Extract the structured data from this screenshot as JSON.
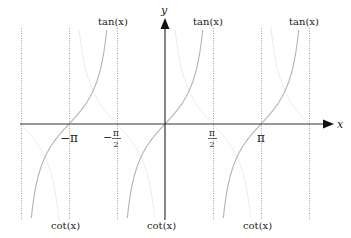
{
  "chart_data": {
    "type": "line",
    "title": "",
    "xlabel": "x",
    "ylabel": "y",
    "x_range": [
      -4.712,
      4.712
    ],
    "y_range": [
      -3,
      3
    ],
    "grid": false,
    "x_tick_labels": [
      "−π",
      "−π/2",
      "π/2",
      "π"
    ],
    "x_tick_values": [
      -3.1416,
      -1.5708,
      1.5708,
      3.1416
    ],
    "asymptotes_x": [
      -4.712,
      -3.1416,
      -1.5708,
      1.5708,
      3.1416,
      4.712
    ],
    "series": [
      {
        "name": "tan(x)",
        "color": "#b3b3b3",
        "branches_centered_at": [
          -3.1416,
          0,
          3.1416
        ],
        "sample_points": [
          [
            -1.2,
            -2.57
          ],
          [
            -0.6,
            -0.68
          ],
          [
            0,
            0
          ],
          [
            0.6,
            0.68
          ],
          [
            1.2,
            2.57
          ]
        ]
      },
      {
        "name": "cot(x)",
        "color": "#ebebeb",
        "branches_between": [
          [
            -4.712,
            -3.1416
          ],
          [
            -3.1416,
            0
          ],
          [
            0,
            3.1416
          ],
          [
            3.1416,
            4.712
          ]
        ],
        "sample_points": [
          [
            0.4,
            2.37
          ],
          [
            0.8,
            0.97
          ],
          [
            1.5708,
            0
          ],
          [
            2.34,
            -0.97
          ],
          [
            2.74,
            -2.37
          ]
        ]
      }
    ],
    "annotations": [
      {
        "text": "tan(x)",
        "position": "top",
        "x": -2.0
      },
      {
        "text": "tan(x)",
        "position": "top",
        "x": 1.15
      },
      {
        "text": "tan(x)",
        "position": "top",
        "x": 4.25
      },
      {
        "text": "cot(x)",
        "position": "bottom",
        "x": -3.1416
      },
      {
        "text": "cot(x)",
        "position": "bottom",
        "x": 0
      },
      {
        "text": "cot(x)",
        "position": "bottom",
        "x": 3.1416
      }
    ]
  },
  "labels": {
    "x_axis": "x",
    "y_axis": "y",
    "tan": "tan(x)",
    "cot": "cot(x)",
    "neg_pi": "−π",
    "pi": "π",
    "neg_sign": "−",
    "pi_sym": "π",
    "two": "2"
  }
}
